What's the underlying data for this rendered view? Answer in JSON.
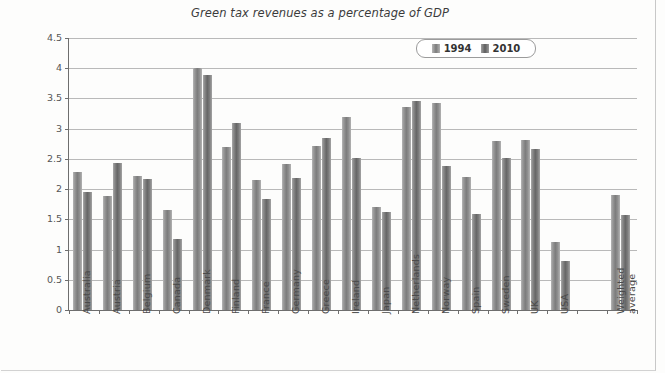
{
  "chart_data": {
    "type": "bar",
    "title": "Green tax revenues as a percentage of GDP",
    "xlabel": "",
    "ylabel": "% of GDP",
    "ylim": [
      0,
      4.5
    ],
    "ytick_step": 0.5,
    "yticks": [
      "0",
      "0.5",
      "1",
      "1.5",
      "2",
      "2.5",
      "3",
      "3.5",
      "4",
      "4.5"
    ],
    "grid": true,
    "legend_position": "top-right-inside",
    "categories": [
      "Australia",
      "Austria",
      "Belgium",
      "Canada",
      "Denmark",
      "Finland",
      "France",
      "Germany",
      "Greece",
      "Ireland",
      "Japan",
      "Netherlands",
      "Norway",
      "Spain",
      "Sweden",
      "UK",
      "USA",
      "",
      "Weighted average"
    ],
    "series": [
      {
        "name": "1994",
        "color": "#7c7c7c",
        "values": [
          2.28,
          1.89,
          2.21,
          1.66,
          4.0,
          2.7,
          2.15,
          2.42,
          2.71,
          3.19,
          1.7,
          3.36,
          3.43,
          2.2,
          2.8,
          2.81,
          1.13,
          null,
          1.9
        ]
      },
      {
        "name": "2010",
        "color": "#666666",
        "values": [
          1.96,
          2.44,
          2.16,
          1.18,
          3.88,
          3.09,
          1.84,
          2.18,
          2.85,
          2.51,
          1.62,
          3.45,
          2.38,
          1.59,
          2.51,
          2.66,
          0.81,
          null,
          1.57
        ]
      }
    ]
  },
  "legend": {
    "entries": [
      {
        "label": "1994"
      },
      {
        "label": "2010"
      }
    ]
  },
  "axis": {
    "y_title": "% of GDP"
  },
  "category_labels_multiline": {
    "Weighted average": [
      "Weighted",
      "average"
    ]
  }
}
